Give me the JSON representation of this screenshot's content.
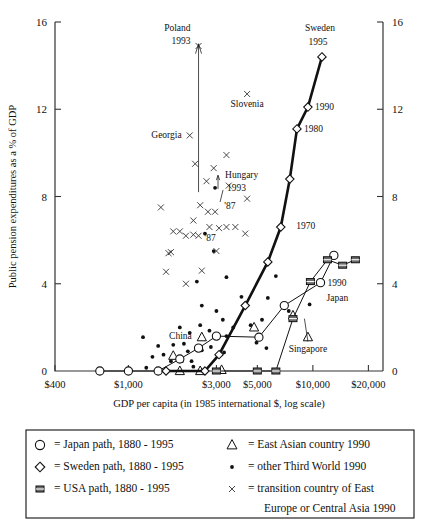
{
  "chart_data": {
    "type": "scatter",
    "title": "",
    "xlabel": "GDP per capita (in 1985 international $, log scale)",
    "ylabel": "Public pension expenditures as a % of GDP",
    "grid": false,
    "xscale": "log",
    "xlim": [
      400,
      24000
    ],
    "ylim": [
      0,
      16
    ],
    "xticks": [
      "$400",
      "$1,000",
      "$3,000",
      "$5,000",
      "$10,000",
      "$20,000"
    ],
    "xtick_values": [
      400,
      1000,
      3000,
      5000,
      10000,
      20000
    ],
    "yticks": [
      "0",
      "4",
      "8",
      "12",
      "16"
    ],
    "ytick_values": [
      0,
      4,
      8,
      12,
      16
    ],
    "right_axis_yticks": [
      "0",
      "4",
      "8",
      "12",
      "16"
    ],
    "legend_position": "below-axis-box",
    "series": [
      {
        "name": "Japan path, 1880 - 1995",
        "marker": "circle-open",
        "points": [
          {
            "x": 700,
            "y": 0.0
          },
          {
            "x": 1000,
            "y": 0.0
          },
          {
            "x": 1450,
            "y": 0.0
          },
          {
            "x": 1900,
            "y": 0.55
          },
          {
            "x": 2400,
            "y": 1.05
          },
          {
            "x": 3000,
            "y": 1.6
          },
          {
            "x": 5100,
            "y": 1.55
          },
          {
            "x": 7000,
            "y": 3.0
          },
          {
            "x": 11000,
            "y": 4.05
          },
          {
            "x": 13000,
            "y": 5.3
          }
        ],
        "labels": [
          {
            "text": "1990",
            "x": 11000,
            "y": 4.05
          },
          {
            "text": "Japan",
            "x": 11000,
            "y": 3.4
          }
        ]
      },
      {
        "name": "Sweden path, 1880 - 1995",
        "marker": "diamond-open",
        "points": [
          {
            "x": 1600,
            "y": 0.0
          },
          {
            "x": 2600,
            "y": 0.0
          },
          {
            "x": 3100,
            "y": 0.75
          },
          {
            "x": 4300,
            "y": 3.0
          },
          {
            "x": 5700,
            "y": 5.0
          },
          {
            "x": 6700,
            "y": 6.6
          },
          {
            "x": 7500,
            "y": 8.8
          },
          {
            "x": 8200,
            "y": 11.1
          },
          {
            "x": 9400,
            "y": 12.1
          },
          {
            "x": 11200,
            "y": 14.4
          }
        ],
        "labels": [
          {
            "text": "Sweden",
            "x": 11200,
            "y": 15.5
          },
          {
            "text": "1995",
            "x": 11200,
            "y": 14.9
          },
          {
            "text": "1990",
            "x": 9400,
            "y": 12.1
          },
          {
            "text": "1980",
            "x": 8200,
            "y": 11.1
          },
          {
            "text": "1970",
            "x": 7000,
            "y": 6.7
          }
        ]
      },
      {
        "name": "USA path, 1880 - 1995",
        "marker": "square-filled",
        "points": [
          {
            "x": 3000,
            "y": 0.0
          },
          {
            "x": 5000,
            "y": 0.0
          },
          {
            "x": 6300,
            "y": 0.0
          },
          {
            "x": 7800,
            "y": 2.4
          },
          {
            "x": 9700,
            "y": 4.1
          },
          {
            "x": 12000,
            "y": 5.1
          },
          {
            "x": 14500,
            "y": 4.85
          },
          {
            "x": 17000,
            "y": 5.1
          }
        ],
        "labels": []
      },
      {
        "name": "East Asian country 1990",
        "marker": "triangle-open",
        "points": [
          {
            "x": 1900,
            "y": 0.0
          },
          {
            "x": 2450,
            "y": 0.0
          },
          {
            "x": 1750,
            "y": 0.7
          },
          {
            "x": 2500,
            "y": 1.55
          },
          {
            "x": 3200,
            "y": 0.05
          },
          {
            "x": 4800,
            "y": 2.0
          },
          {
            "x": 7800,
            "y": 2.55
          },
          {
            "x": 9400,
            "y": 1.55
          }
        ],
        "labels": [
          {
            "text": "China",
            "x": 2500,
            "y": 1.6
          },
          {
            "text": "Singapore",
            "x": 9400,
            "y": 1.05
          }
        ]
      },
      {
        "name": "other Third World 1990",
        "marker": "dot-filled",
        "points": [
          {
            "x": 1030,
            "y": 0.05
          },
          {
            "x": 1700,
            "y": 0.45
          },
          {
            "x": 1950,
            "y": 0.45
          },
          {
            "x": 2200,
            "y": 0.45
          },
          {
            "x": 1350,
            "y": 0.65
          },
          {
            "x": 1550,
            "y": 0.75
          },
          {
            "x": 2100,
            "y": 0.9
          },
          {
            "x": 2500,
            "y": 0.95
          },
          {
            "x": 1450,
            "y": 1.15
          },
          {
            "x": 1750,
            "y": 1.2
          },
          {
            "x": 2000,
            "y": 1.25
          },
          {
            "x": 2800,
            "y": 1.1
          },
          {
            "x": 3300,
            "y": 0.85
          },
          {
            "x": 3000,
            "y": 1.5
          },
          {
            "x": 3400,
            "y": 1.6
          },
          {
            "x": 2150,
            "y": 1.75
          },
          {
            "x": 2750,
            "y": 1.85
          },
          {
            "x": 1900,
            "y": 2.0
          },
          {
            "x": 2450,
            "y": 2.1
          },
          {
            "x": 3250,
            "y": 2.35
          },
          {
            "x": 3700,
            "y": 2.0
          },
          {
            "x": 4600,
            "y": 2.1
          },
          {
            "x": 5300,
            "y": 2.35
          },
          {
            "x": 3000,
            "y": 2.75
          },
          {
            "x": 2500,
            "y": 3.0
          },
          {
            "x": 4100,
            "y": 3.4
          },
          {
            "x": 5700,
            "y": 3.35
          },
          {
            "x": 7400,
            "y": 2.75
          },
          {
            "x": 6300,
            "y": 4.35
          },
          {
            "x": 9600,
            "y": 3.05
          },
          {
            "x": 2350,
            "y": 4.1
          },
          {
            "x": 3400,
            "y": 4.3
          },
          {
            "x": 2900,
            "y": 5.5
          },
          {
            "x": 2600,
            "y": 6.3
          },
          {
            "x": 2950,
            "y": 8.4
          },
          {
            "x": 1250,
            "y": 0.15
          },
          {
            "x": 1200,
            "y": 1.55
          },
          {
            "x": 2250,
            "y": 0.2
          },
          {
            "x": 4950,
            "y": 1.3
          },
          {
            "x": 5600,
            "y": 1.05
          }
        ]
      },
      {
        "name": "transition country of East Europe or Central Asia 1990",
        "marker": "x-cross",
        "points": [
          {
            "x": 2400,
            "y": 14.9
          },
          {
            "x": 4400,
            "y": 12.7
          },
          {
            "x": 2150,
            "y": 10.8
          },
          {
            "x": 3400,
            "y": 9.9
          },
          {
            "x": 2900,
            "y": 9.3
          },
          {
            "x": 2450,
            "y": 7.6
          },
          {
            "x": 2700,
            "y": 7.3
          },
          {
            "x": 2950,
            "y": 7.3
          },
          {
            "x": 2300,
            "y": 9.5
          },
          {
            "x": 3500,
            "y": 8.5
          },
          {
            "x": 2250,
            "y": 6.9
          },
          {
            "x": 3100,
            "y": 6.55
          },
          {
            "x": 2750,
            "y": 6.6
          },
          {
            "x": 3400,
            "y": 6.6
          },
          {
            "x": 3800,
            "y": 6.6
          },
          {
            "x": 1750,
            "y": 6.4
          },
          {
            "x": 1900,
            "y": 6.4
          },
          {
            "x": 2050,
            "y": 6.2
          },
          {
            "x": 2250,
            "y": 6.25
          },
          {
            "x": 2400,
            "y": 6.2
          },
          {
            "x": 4300,
            "y": 6.3
          },
          {
            "x": 1650,
            "y": 5.4
          },
          {
            "x": 1700,
            "y": 5.45
          },
          {
            "x": 3000,
            "y": 5.5
          },
          {
            "x": 1600,
            "y": 4.55
          },
          {
            "x": 2500,
            "y": 4.6
          },
          {
            "x": 2050,
            "y": 4.0
          },
          {
            "x": 2650,
            "y": 8.7
          },
          {
            "x": 4400,
            "y": 7.9
          },
          {
            "x": 1500,
            "y": 7.5
          }
        ],
        "labels": [
          {
            "text": "Poland",
            "x": 2400,
            "y": 15.6
          },
          {
            "text": "1993",
            "x": 2400,
            "y": 15.0
          },
          {
            "text": "Slovenia",
            "x": 4400,
            "y": 12.1
          },
          {
            "text": "Georgia",
            "x": 2150,
            "y": 10.8
          },
          {
            "text": "Hungary",
            "x": 3100,
            "y": 9.0
          },
          {
            "text": "1993",
            "x": 3100,
            "y": 8.5
          },
          {
            "text": "'87",
            "x": 3150,
            "y": 7.6
          },
          {
            "text": "'87",
            "x": 2500,
            "y": 6.1
          }
        ]
      }
    ]
  },
  "legend": {
    "items": [
      {
        "marker": "circle-open",
        "label": "= Japan path, 1880 - 1995"
      },
      {
        "marker": "diamond-open",
        "label": "= Sweden path, 1880 - 1995"
      },
      {
        "marker": "square-filled",
        "label": "= USA path, 1880 - 1995"
      },
      {
        "marker": "triangle-open",
        "label": "= East Asian country 1990"
      },
      {
        "marker": "dot-filled",
        "label": "= other Third World 1990"
      },
      {
        "marker": "x-cross",
        "label": "= transition country of East"
      },
      {
        "marker": "none",
        "label": "Europe or Central Asia 1990"
      }
    ]
  }
}
